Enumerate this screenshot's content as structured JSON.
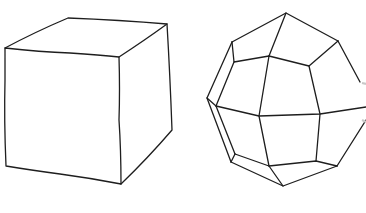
{
  "figure": {
    "background": "#ffffff",
    "line_color": "#1e1e1e",
    "shapes": [
      {
        "name": "cube",
        "label": "",
        "vertices": {
          "front_top_left": [
            5,
            48
          ],
          "front_top_right": [
            119,
            57
          ],
          "front_bottom_right": [
            121,
            184
          ],
          "front_bottom_left": [
            6,
            166
          ],
          "back_top_left": [
            68,
            18
          ],
          "back_top_right": [
            167,
            24
          ],
          "back_bottom_right": [
            172,
            130
          ]
        }
      },
      {
        "name": "polyhedron",
        "label": "",
        "note": "faceted rounded solid, partially clipped on right edge"
      }
    ]
  }
}
